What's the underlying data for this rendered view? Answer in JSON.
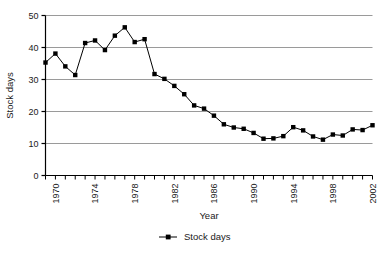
{
  "chart_data": {
    "type": "line",
    "title": "",
    "xlabel": "Year",
    "ylabel": "Stock days",
    "xlim": [
      1969,
      2002
    ],
    "ylim": [
      0,
      50
    ],
    "ytick_values": [
      0,
      10,
      20,
      30,
      40,
      50
    ],
    "ytick_labels": [
      "0",
      "10",
      "20",
      "30",
      "40",
      "50"
    ],
    "xtick_labels": [
      "1970",
      "1974",
      "1978",
      "1982",
      "1986",
      "1990",
      "1994",
      "1998",
      "2002"
    ],
    "xtick_label_values": [
      1970,
      1974,
      1978,
      1982,
      1986,
      1990,
      1994,
      1998,
      2002
    ],
    "xtick_minor_step": 1,
    "grid": "horizontal",
    "legend": [
      "Stock days"
    ],
    "legend_position": "bottom",
    "marker": "square",
    "line_color": "#000000",
    "marker_color": "#000000",
    "grid_color": "#9a9a9a",
    "axis_color": "#000000",
    "series": [
      {
        "name": "Stock days",
        "x": [
          1969,
          1970,
          1971,
          1972,
          1973,
          1974,
          1975,
          1976,
          1977,
          1978,
          1979,
          1980,
          1981,
          1982,
          1983,
          1984,
          1985,
          1986,
          1987,
          1988,
          1989,
          1990,
          1991,
          1992,
          1993,
          1994,
          1995,
          1996,
          1997,
          1998,
          1999,
          2000,
          2001,
          2002
        ],
        "values": [
          35.3,
          38.1,
          34.1,
          31.4,
          41.4,
          42.2,
          39.2,
          43.7,
          46.3,
          41.7,
          42.6,
          31.7,
          30.2,
          28.0,
          25.4,
          21.9,
          20.9,
          18.7,
          16.0,
          15.0,
          14.6,
          13.3,
          11.5,
          11.6,
          12.3,
          15.1,
          14.1,
          12.2,
          11.2,
          12.8,
          12.5,
          14.4,
          14.2,
          15.7
        ]
      }
    ]
  }
}
